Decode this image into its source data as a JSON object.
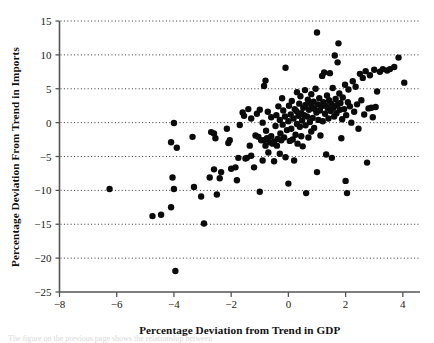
{
  "chart_data": {
    "type": "scatter",
    "title": "",
    "xlabel": "Percentage Deviation from Trend in GDP",
    "ylabel": "Percentage Deviation From Trend in Imports",
    "xlim": [
      -8,
      4.6
    ],
    "ylim": [
      -25,
      15
    ],
    "xticks": [
      -8,
      -6,
      -4,
      -2,
      0,
      2,
      4
    ],
    "xticklabels": [
      "−8",
      "−6",
      "−4",
      "−2",
      "0",
      "2",
      "4"
    ],
    "yticks": [
      15,
      10,
      5,
      0,
      -5,
      -10,
      -15,
      -20,
      -25
    ],
    "yticklabels": [
      "15",
      "10",
      "5",
      "0",
      "−5",
      "−10",
      "−15",
      "−20",
      "−25"
    ],
    "grid": "horizontal-dotted",
    "legend": "none",
    "marker": {
      "shape": "circle",
      "color": "#0b0b0b",
      "size_px": 4.2
    },
    "series": [
      {
        "name": "country-year observations",
        "points": [
          [
            -6.25,
            -9.8
          ],
          [
            -4.75,
            -13.8
          ],
          [
            -4.45,
            -13.6
          ],
          [
            -4.1,
            -12.5
          ],
          [
            -4.05,
            -8.1
          ],
          [
            -4.0,
            -0.05
          ],
          [
            -4.0,
            -9.8
          ],
          [
            -3.95,
            -21.9
          ],
          [
            -3.9,
            -3.7
          ],
          [
            -4.1,
            -2.9
          ],
          [
            -3.35,
            -2.1
          ],
          [
            -3.3,
            -9.5
          ],
          [
            -3.05,
            -10.9
          ],
          [
            -2.95,
            -14.9
          ],
          [
            -2.75,
            -8.1
          ],
          [
            -2.7,
            -1.4
          ],
          [
            -2.6,
            -1.6
          ],
          [
            -2.6,
            -6.9
          ],
          [
            -2.55,
            -2.3
          ],
          [
            -2.5,
            -10.6
          ],
          [
            -2.4,
            -8.2
          ],
          [
            -2.35,
            -7.3
          ],
          [
            -2.15,
            -0.9
          ],
          [
            -2.1,
            -3.0
          ],
          [
            -2.05,
            -2.6
          ],
          [
            -2.0,
            -6.8
          ],
          [
            -1.85,
            -6.6
          ],
          [
            -1.8,
            -8.5
          ],
          [
            -1.75,
            -5.2
          ],
          [
            -1.7,
            -0.35
          ],
          [
            -1.6,
            1.5
          ],
          [
            -1.55,
            1.0
          ],
          [
            -1.5,
            -5.3
          ],
          [
            -1.45,
            -5.2
          ],
          [
            -1.4,
            2.0
          ],
          [
            -1.35,
            -3.4
          ],
          [
            -1.3,
            -4.9
          ],
          [
            -1.3,
            0.6
          ],
          [
            -1.2,
            -6.6
          ],
          [
            -1.15,
            -1.9
          ],
          [
            -1.1,
            1.3
          ],
          [
            -1.05,
            -2.1
          ],
          [
            -1.0,
            -10.2
          ],
          [
            -1.0,
            1.9
          ],
          [
            -0.95,
            -2.6
          ],
          [
            -0.9,
            -5.6
          ],
          [
            -0.9,
            0.0
          ],
          [
            -0.85,
            -2.6
          ],
          [
            -0.85,
            5.4
          ],
          [
            -0.8,
            -3.4
          ],
          [
            -0.8,
            6.2
          ],
          [
            -0.78,
            -1.2
          ],
          [
            -0.75,
            -2.3
          ],
          [
            -0.72,
            1.6
          ],
          [
            -0.7,
            -4.4
          ],
          [
            -0.65,
            -2.9
          ],
          [
            -0.6,
            -2.0
          ],
          [
            -0.6,
            0.8
          ],
          [
            -0.55,
            -3.1
          ],
          [
            -0.5,
            -2.8
          ],
          [
            -0.5,
            -5.7
          ],
          [
            -0.45,
            -0.5
          ],
          [
            -0.42,
            1.1
          ],
          [
            -0.4,
            -3.4
          ],
          [
            -0.38,
            -2.4
          ],
          [
            -0.35,
            2.4
          ],
          [
            -0.3,
            -4.6
          ],
          [
            -0.3,
            0.4
          ],
          [
            -0.28,
            -1.6
          ],
          [
            -0.25,
            -2.6
          ],
          [
            -0.22,
            3.6
          ],
          [
            -0.2,
            -0.3
          ],
          [
            -0.18,
            1.8
          ],
          [
            -0.15,
            -2.2
          ],
          [
            -0.12,
            0.9
          ],
          [
            -0.1,
            -5.1
          ],
          [
            -0.1,
            8.1
          ],
          [
            -0.05,
            -1.1
          ],
          [
            0.0,
            -9.0
          ],
          [
            0.0,
            0.2
          ],
          [
            0.02,
            2.5
          ],
          [
            0.05,
            -2.7
          ],
          [
            0.08,
            1.2
          ],
          [
            0.1,
            -0.9
          ],
          [
            0.12,
            3.2
          ],
          [
            0.15,
            -2.5
          ],
          [
            0.18,
            0.6
          ],
          [
            0.2,
            -5.6
          ],
          [
            0.22,
            2.0
          ],
          [
            0.25,
            -1.8
          ],
          [
            0.28,
            1.7
          ],
          [
            0.3,
            -0.2
          ],
          [
            0.3,
            4.5
          ],
          [
            0.32,
            -3.1
          ],
          [
            0.35,
            1.0
          ],
          [
            0.38,
            2.8
          ],
          [
            0.4,
            -0.6
          ],
          [
            0.42,
            3.9
          ],
          [
            0.45,
            -2.0
          ],
          [
            0.45,
            1.4
          ],
          [
            0.48,
            0.3
          ],
          [
            0.5,
            -3.5
          ],
          [
            0.52,
            2.2
          ],
          [
            0.55,
            1.1
          ],
          [
            0.58,
            4.8
          ],
          [
            0.6,
            -0.4
          ],
          [
            0.6,
            2.6
          ],
          [
            0.62,
            -10.4
          ],
          [
            0.65,
            0.9
          ],
          [
            0.68,
            3.4
          ],
          [
            0.7,
            -2.2
          ],
          [
            0.72,
            1.9
          ],
          [
            0.75,
            0.1
          ],
          [
            0.78,
            2.9
          ],
          [
            0.8,
            -1.3
          ],
          [
            0.8,
            4.2
          ],
          [
            0.82,
            2.3
          ],
          [
            0.85,
            0.7
          ],
          [
            0.88,
            3.1
          ],
          [
            0.9,
            -0.8
          ],
          [
            0.92,
            2.0
          ],
          [
            0.95,
            5.0
          ],
          [
            0.98,
            1.5
          ],
          [
            1.0,
            -7.3
          ],
          [
            1.0,
            13.3
          ],
          [
            1.02,
            2.7
          ],
          [
            1.05,
            0.4
          ],
          [
            1.08,
            3.6
          ],
          [
            1.1,
            1.8
          ],
          [
            1.12,
            -1.9
          ],
          [
            1.15,
            2.4
          ],
          [
            1.18,
            6.9
          ],
          [
            1.2,
            0.2
          ],
          [
            1.22,
            3.0
          ],
          [
            1.25,
            7.4
          ],
          [
            1.28,
            1.3
          ],
          [
            1.3,
            2.5
          ],
          [
            1.32,
            -4.7
          ],
          [
            1.35,
            4.0
          ],
          [
            1.38,
            2.1
          ],
          [
            1.4,
            0.6
          ],
          [
            1.42,
            3.3
          ],
          [
            1.45,
            7.3
          ],
          [
            1.48,
            1.7
          ],
          [
            1.5,
            2.8
          ],
          [
            1.52,
            -5.2
          ],
          [
            1.55,
            5.1
          ],
          [
            1.58,
            2.2
          ],
          [
            1.6,
            0.9
          ],
          [
            1.62,
            9.9
          ],
          [
            1.65,
            3.5
          ],
          [
            1.68,
            1.4
          ],
          [
            1.7,
            2.6
          ],
          [
            1.72,
            8.9
          ],
          [
            1.75,
            11.7
          ],
          [
            1.78,
            4.3
          ],
          [
            1.8,
            1.9
          ],
          [
            1.82,
            2.9
          ],
          [
            1.85,
            -2.3
          ],
          [
            1.88,
            0.5
          ],
          [
            1.9,
            3.7
          ],
          [
            1.95,
            2.0
          ],
          [
            1.98,
            5.6
          ],
          [
            2.0,
            -8.6
          ],
          [
            2.02,
            1.1
          ],
          [
            2.05,
            -10.4
          ],
          [
            2.08,
            3.0
          ],
          [
            2.1,
            4.9
          ],
          [
            2.15,
            2.4
          ],
          [
            2.2,
            0.0
          ],
          [
            2.25,
            6.1
          ],
          [
            2.3,
            1.6
          ],
          [
            2.35,
            5.3
          ],
          [
            2.4,
            2.7
          ],
          [
            2.45,
            -0.9
          ],
          [
            2.5,
            7.2
          ],
          [
            2.55,
            3.3
          ],
          [
            2.6,
            6.6
          ],
          [
            2.65,
            1.2
          ],
          [
            2.7,
            7.6
          ],
          [
            2.75,
            -5.9
          ],
          [
            2.8,
            2.1
          ],
          [
            2.85,
            7.0
          ],
          [
            2.9,
            2.2
          ],
          [
            2.95,
            0.8
          ],
          [
            3.0,
            7.8
          ],
          [
            3.05,
            2.3
          ],
          [
            3.1,
            4.6
          ],
          [
            3.2,
            7.5
          ],
          [
            3.3,
            7.9
          ],
          [
            3.45,
            7.7
          ],
          [
            3.55,
            7.9
          ],
          [
            3.7,
            8.2
          ],
          [
            3.85,
            9.6
          ],
          [
            4.05,
            5.9
          ]
        ]
      }
    ]
  },
  "axes": {
    "x_tick_unit_px": 28.8,
    "y_tick_unit_px": 6.78
  },
  "caption_ghost": "The figure on the previous page shows the relationship between"
}
